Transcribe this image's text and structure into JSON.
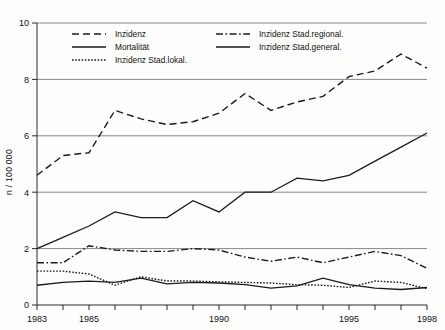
{
  "chart_data": {
    "type": "line",
    "title": "",
    "xlabel": "",
    "ylabel": "n / 100 000",
    "xlim": [
      1983,
      1998
    ],
    "ylim": [
      0,
      10
    ],
    "x": [
      1983,
      1984,
      1985,
      1986,
      1987,
      1988,
      1989,
      1990,
      1991,
      1992,
      1993,
      1994,
      1995,
      1996,
      1997,
      1998
    ],
    "xticks": [
      1983,
      1984,
      1985,
      1986,
      1987,
      1988,
      1989,
      1990,
      1991,
      1992,
      1993,
      1994,
      1995,
      1996,
      1997,
      1998
    ],
    "xticklabels": [
      "1983",
      "",
      "1985",
      "",
      "",
      "",
      "",
      "1990",
      "",
      "",
      "",
      "",
      "1995",
      "",
      "",
      "1998"
    ],
    "yticks": [
      0,
      2,
      4,
      6,
      8,
      10
    ],
    "yticklabels": [
      "0",
      "2",
      "4",
      "6",
      "8",
      "10"
    ],
    "grid": "horizontal",
    "legend_position": "top-inside",
    "series": [
      {
        "name": "Inzidenz",
        "style": "dashed",
        "values": [
          4.6,
          5.3,
          5.4,
          6.9,
          6.6,
          6.4,
          6.5,
          6.8,
          7.5,
          6.9,
          7.2,
          7.4,
          8.1,
          8.3,
          8.9,
          8.4
        ]
      },
      {
        "name": "Mortalität",
        "style": "solid",
        "values": [
          0.7,
          0.8,
          0.85,
          0.8,
          0.95,
          0.75,
          0.8,
          0.78,
          0.72,
          0.6,
          0.68,
          0.95,
          0.72,
          0.6,
          0.55,
          0.62
        ]
      },
      {
        "name": "Inzidenz Stad.lokal.",
        "style": "dotted",
        "values": [
          1.2,
          1.2,
          1.1,
          0.7,
          1.0,
          0.85,
          0.85,
          0.82,
          0.8,
          0.78,
          0.72,
          0.7,
          0.62,
          0.85,
          0.8,
          0.58
        ]
      },
      {
        "name": "Inzidenz Stad.regional.",
        "style": "dashdot",
        "values": [
          1.5,
          1.5,
          2.1,
          1.95,
          1.9,
          1.9,
          2.0,
          1.95,
          1.7,
          1.55,
          1.7,
          1.5,
          1.7,
          1.9,
          1.75,
          1.3
        ]
      },
      {
        "name": "Inzidenz Stad.general.",
        "style": "solid",
        "values": [
          2.0,
          2.4,
          2.8,
          3.3,
          3.1,
          3.1,
          3.7,
          3.3,
          4.0,
          4.0,
          4.5,
          4.4,
          4.6,
          5.1,
          5.6,
          6.1
        ]
      }
    ],
    "legend": [
      {
        "label": "Inzidenz",
        "style": "dashed",
        "column": 1
      },
      {
        "label": "Mortalität",
        "style": "solid",
        "column": 1
      },
      {
        "label": "Inzidenz Stad.lokal.",
        "style": "dotted",
        "column": 1
      },
      {
        "label": "Inzidenz Stad.regional.",
        "style": "dashdot",
        "column": 2
      },
      {
        "label": "Inzidenz Stad.general.",
        "style": "solid",
        "column": 2
      }
    ]
  }
}
